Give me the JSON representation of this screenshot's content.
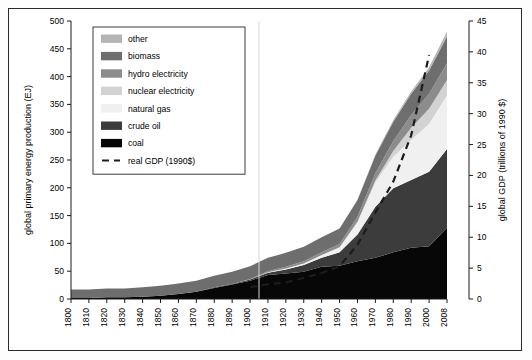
{
  "chart_data": {
    "type": "area",
    "title": "",
    "xlabel": "",
    "ylabel": "global primary energy production (EJ)",
    "y2label": "global GDP (trillions of 1990 $)",
    "xlim": [
      1800,
      2008
    ],
    "ylim": [
      0,
      500
    ],
    "y2lim": [
      0,
      45
    ],
    "yticks": [
      0,
      50,
      100,
      150,
      200,
      250,
      300,
      350,
      400,
      450,
      500
    ],
    "y2ticks": [
      0,
      5,
      10,
      15,
      20,
      25,
      30,
      35,
      40,
      45
    ],
    "xticks": [
      1800,
      1810,
      1820,
      1830,
      1840,
      1850,
      1860,
      1870,
      1880,
      1890,
      1900,
      1910,
      1920,
      1930,
      1940,
      1950,
      1960,
      1970,
      1980,
      1990,
      2000,
      2008
    ],
    "xticklabels": [
      "1800",
      "1810",
      "1820",
      "1830",
      "1840",
      "1850",
      "1860",
      "1870",
      "1880",
      "1890",
      "1900",
      "1910",
      "1920",
      "1930",
      "1940",
      "1950",
      "1960",
      "1970",
      "1980",
      "1990",
      "2000",
      "2008"
    ],
    "grid": false,
    "legend_position": "upper-left",
    "stack_order_bottom_to_top": [
      "coal",
      "crude oil",
      "natural gas",
      "nuclear electricity",
      "hydro electricity",
      "biomass",
      "other"
    ],
    "x": [
      1800,
      1810,
      1820,
      1830,
      1840,
      1850,
      1860,
      1870,
      1880,
      1890,
      1900,
      1910,
      1920,
      1930,
      1940,
      1950,
      1960,
      1970,
      1980,
      1990,
      2000,
      2008
    ],
    "series": [
      {
        "name": "coal",
        "color": "#070707",
        "values": [
          2,
          2,
          3,
          3,
          4,
          6,
          9,
          13,
          20,
          26,
          33,
          43,
          46,
          49,
          58,
          60,
          68,
          74,
          84,
          92,
          95,
          128
        ]
      },
      {
        "name": "crude oil",
        "color": "#3c3c3c",
        "values": [
          0,
          0,
          0,
          0,
          0,
          0,
          0,
          0,
          1,
          1,
          2,
          4,
          7,
          12,
          16,
          24,
          48,
          92,
          115,
          122,
          134,
          142
        ]
      },
      {
        "name": "natural gas",
        "color": "#f0f0f0",
        "values": [
          0,
          0,
          0,
          0,
          0,
          0,
          0,
          0,
          0,
          0,
          0,
          1,
          2,
          3,
          5,
          9,
          22,
          44,
          57,
          72,
          86,
          96
        ]
      },
      {
        "name": "nuclear electricity",
        "color": "#d2d2d2",
        "values": [
          0,
          0,
          0,
          0,
          0,
          0,
          0,
          0,
          0,
          0,
          0,
          0,
          0,
          0,
          0,
          0,
          1,
          3,
          10,
          22,
          27,
          28
        ]
      },
      {
        "name": "hydro electricity",
        "color": "#8c8c8c",
        "values": [
          0,
          0,
          0,
          0,
          0,
          0,
          0,
          0,
          0,
          0,
          1,
          2,
          3,
          4,
          5,
          6,
          9,
          13,
          18,
          23,
          27,
          30
        ]
      },
      {
        "name": "biomass",
        "color": "#6e6e6e",
        "values": [
          15,
          15,
          16,
          16,
          17,
          18,
          19,
          20,
          21,
          22,
          23,
          24,
          25,
          26,
          27,
          28,
          30,
          32,
          35,
          38,
          42,
          48
        ]
      },
      {
        "name": "other",
        "color": "#b4b4b4",
        "values": [
          0,
          0,
          0,
          0,
          0,
          0,
          0,
          0,
          0,
          0,
          0,
          0,
          0,
          0,
          0,
          0,
          1,
          2,
          3,
          4,
          6,
          9
        ]
      }
    ],
    "gdp": {
      "name": "real GDP (1990$)",
      "label": "real GDP (1990$)",
      "color": "#1c1c1c",
      "axis": "right",
      "style": "dashed",
      "x": [
        1900,
        1910,
        1920,
        1930,
        1940,
        1950,
        1960,
        1970,
        1980,
        1990,
        2000
      ],
      "values": [
        1.9,
        2.4,
        2.7,
        3.4,
        4.2,
        5.3,
        8.8,
        14.0,
        19.0,
        26.5,
        39.5
      ]
    }
  },
  "legend": {
    "items": [
      {
        "label": "other",
        "color": "#b4b4b4",
        "type": "swatch"
      },
      {
        "label": "biomass",
        "color": "#6e6e6e",
        "type": "swatch"
      },
      {
        "label": "hydro electricity",
        "color": "#8c8c8c",
        "type": "swatch"
      },
      {
        "label": "nuclear electricity",
        "color": "#d2d2d2",
        "type": "swatch"
      },
      {
        "label": "natural gas",
        "color": "#f0f0f0",
        "type": "swatch"
      },
      {
        "label": "crude oil",
        "color": "#3c3c3c",
        "type": "swatch"
      },
      {
        "label": "coal",
        "color": "#070707",
        "type": "swatch"
      },
      {
        "label": "real GDP (1990$)",
        "color": "#1c1c1c",
        "type": "dashline"
      }
    ]
  }
}
